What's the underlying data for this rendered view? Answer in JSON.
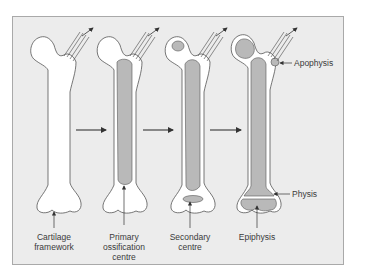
{
  "figure": {
    "colors": {
      "background": "#ececec",
      "cartilage": "#ffffff",
      "bone": "#b9b9b9",
      "outline": "#555555",
      "frame_border": "#a9a9a9",
      "text": "#3a3a3a"
    },
    "stages": [
      {
        "label_lines": [
          "Cartilage",
          "framework"
        ]
      },
      {
        "label_lines": [
          "Primary",
          "ossification",
          "centre"
        ]
      },
      {
        "label_lines": [
          "Secondary",
          "centre"
        ]
      },
      {
        "label_lines": [
          "Epiphysis"
        ]
      }
    ],
    "side_labels": {
      "apophysis": "Apophysis",
      "physis": "Physis"
    }
  }
}
